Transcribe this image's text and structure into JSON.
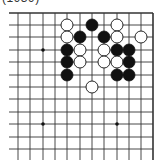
{
  "caption": "(1939)",
  "board": {
    "colors": {
      "line": "#333333",
      "black": "#111111",
      "white": "#ffffff",
      "background": "#ffffff"
    },
    "columns_x": [
      18,
      30,
      43,
      55,
      67,
      80,
      92,
      104,
      117,
      129,
      141,
      153
    ],
    "rows_y": [
      13,
      25,
      37,
      50,
      62,
      75,
      87,
      99,
      112,
      124,
      137,
      149
    ],
    "left_open_x": 9,
    "bottom_open_y": 160,
    "edges": [
      "top",
      "right"
    ],
    "stone_radius": 6,
    "star_points": [
      {
        "col": 2,
        "row": 3
      },
      {
        "col": 2,
        "row": 9
      },
      {
        "col": 8,
        "row": 9
      }
    ],
    "stones": [
      {
        "col": 4,
        "row": 1,
        "color": "white"
      },
      {
        "col": 6,
        "row": 1,
        "color": "black"
      },
      {
        "col": 8,
        "row": 1,
        "color": "white"
      },
      {
        "col": 4,
        "row": 2,
        "color": "white"
      },
      {
        "col": 5,
        "row": 2,
        "color": "black"
      },
      {
        "col": 7,
        "row": 2,
        "color": "black"
      },
      {
        "col": 8,
        "row": 2,
        "color": "white"
      },
      {
        "col": 10,
        "row": 2,
        "color": "white"
      },
      {
        "col": 4,
        "row": 3,
        "color": "black"
      },
      {
        "col": 5,
        "row": 3,
        "color": "white"
      },
      {
        "col": 7,
        "row": 3,
        "color": "white"
      },
      {
        "col": 8,
        "row": 3,
        "color": "black"
      },
      {
        "col": 9,
        "row": 3,
        "color": "black"
      },
      {
        "col": 4,
        "row": 4,
        "color": "black"
      },
      {
        "col": 5,
        "row": 4,
        "color": "white"
      },
      {
        "col": 7,
        "row": 4,
        "color": "white"
      },
      {
        "col": 8,
        "row": 4,
        "color": "white"
      },
      {
        "col": 9,
        "row": 4,
        "color": "black"
      },
      {
        "col": 4,
        "row": 5,
        "color": "black"
      },
      {
        "col": 8,
        "row": 5,
        "color": "black"
      },
      {
        "col": 9,
        "row": 5,
        "color": "black"
      },
      {
        "col": 6,
        "row": 6,
        "color": "white"
      }
    ]
  }
}
